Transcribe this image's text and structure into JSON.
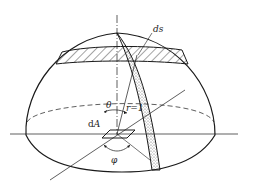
{
  "figure": {
    "labels": {
      "ds": "ds",
      "theta": "θ",
      "r": "r=1",
      "dA_prefix": "d",
      "dA_var": "A",
      "phi": "φ"
    },
    "colors": {
      "line": "#1a1a1a",
      "background": "#ffffff",
      "stipple": "#555555"
    }
  }
}
